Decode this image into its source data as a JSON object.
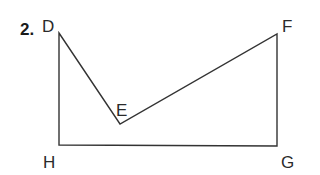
{
  "problem_number": "2.",
  "figure": {
    "stroke_color": "#333333",
    "vertices": {
      "D": {
        "label": "D",
        "x": 59,
        "y": 33
      },
      "E": {
        "label": "E",
        "x": 120,
        "y": 124
      },
      "F": {
        "label": "F",
        "x": 277,
        "y": 34
      },
      "G": {
        "label": "G",
        "x": 277,
        "y": 146
      },
      "H": {
        "label": "H",
        "x": 59,
        "y": 145
      }
    },
    "polygon_order": [
      "D",
      "E",
      "F",
      "G",
      "H"
    ]
  }
}
